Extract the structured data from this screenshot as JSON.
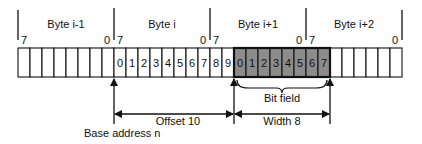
{
  "diagram": {
    "bytes": [
      {
        "label": "Byte i-1",
        "msb": "7",
        "lsb": "0"
      },
      {
        "label": "Byte i",
        "msb": "7",
        "lsb": "0"
      },
      {
        "label": "Byte i+1",
        "msb": "7",
        "lsb": "0"
      },
      {
        "label": "Byte i+2",
        "msb": "7",
        "lsb": "0"
      }
    ],
    "cells": {
      "count": 32,
      "offset_numbers": [
        "0",
        "1",
        "2",
        "3",
        "4",
        "5",
        "6",
        "7",
        "8",
        "9"
      ],
      "field_numbers": [
        "0",
        "1",
        "2",
        "3",
        "4",
        "5",
        "6",
        "7"
      ],
      "offset_start_index": 8,
      "field_start_index": 18
    },
    "annotations": {
      "bit_field": "Bit field",
      "offset": "Offset 10",
      "width": "Width 8",
      "base_address": "Base address n"
    },
    "colors": {
      "field_fill": "#8c8c8c",
      "line": "#111111"
    }
  }
}
